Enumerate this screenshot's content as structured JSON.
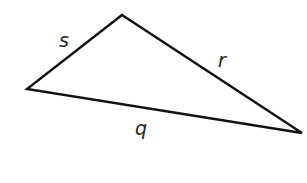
{
  "diagram": {
    "type": "triangle",
    "stroke_color": "#111111",
    "background": "#ffffff",
    "vertices": {
      "top": {
        "x": 122,
        "y": 15
      },
      "left": {
        "x": 27,
        "y": 89
      },
      "right": {
        "x": 302,
        "y": 133
      }
    },
    "sides": [
      {
        "label": "s",
        "from": "left",
        "to": "top",
        "label_pos": {
          "x": 64,
          "y": 47
        }
      },
      {
        "label": "r",
        "from": "top",
        "to": "right",
        "label_pos": {
          "x": 222,
          "y": 67
        }
      },
      {
        "label": "q",
        "from": "left",
        "to": "right",
        "label_pos": {
          "x": 141,
          "y": 135
        }
      }
    ]
  }
}
